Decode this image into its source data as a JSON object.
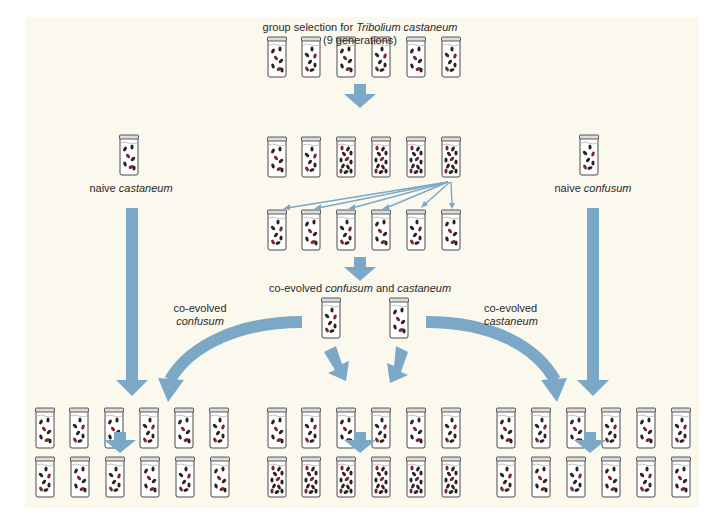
{
  "title": {
    "line1_prefix": "group selection for ",
    "line1_italic": "Tribolium castaneum",
    "line2": "(9 generations)"
  },
  "labels": {
    "naive_castaneum": {
      "prefix": "naive ",
      "italic": "castaneum"
    },
    "naive_confusum": {
      "prefix": "naive ",
      "italic": "confusum"
    },
    "coevolved_pair": {
      "prefix": "co-evolved ",
      "italic1": "confusum",
      "mid": " and ",
      "italic2": "castaneum"
    },
    "coevolved_confusum": {
      "line1": "co-evolved",
      "italic": "confusum"
    },
    "coevolved_castaneum": {
      "line1": "co-evolved",
      "italic": "castaneum"
    }
  },
  "colors": {
    "background": "#ffffff",
    "panel": "#fbf9ee",
    "arrow": "#7ba8c7",
    "beetle_dark": "#2b2222",
    "beetle_red": "#7a2a22"
  },
  "jar_rows": {
    "selection_row1": {
      "count": 6,
      "y": 37
    },
    "selection_row2": {
      "count": 6,
      "y": 137
    },
    "selection_row3": {
      "count": 6,
      "y": 210
    },
    "coevolved_pair": {
      "count": 2,
      "y": 298
    },
    "bottom_left_row1": {
      "count": 6,
      "y": 408
    },
    "bottom_left_row2": {
      "count": 6,
      "y": 457
    },
    "bottom_mid_row1": {
      "count": 6,
      "y": 408
    },
    "bottom_mid_row2": {
      "count": 6,
      "y": 457
    },
    "bottom_right_row1": {
      "count": 6,
      "y": 408
    },
    "bottom_right_row2": {
      "count": 6,
      "y": 457
    },
    "naive_castaneum": {
      "count": 1,
      "y": 135
    },
    "naive_confusum": {
      "count": 1,
      "y": 135
    }
  }
}
